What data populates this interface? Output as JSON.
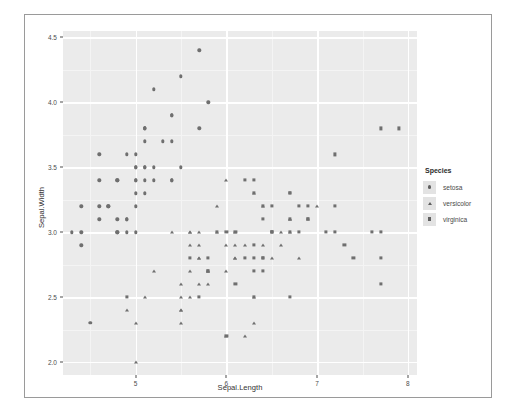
{
  "chart_data": {
    "type": "scatter",
    "title": "",
    "xlabel": "Sepal.Length",
    "ylabel": "Sepal.Width",
    "xlim": [
      4.2,
      8.1
    ],
    "ylim": [
      1.9,
      4.55
    ],
    "xticks": [
      5,
      6,
      7,
      8
    ],
    "xtick_labels": [
      "5",
      "6",
      "7",
      "8"
    ],
    "yticks": [
      2.0,
      2.5,
      3.0,
      3.5,
      4.0,
      4.5
    ],
    "ytick_labels": [
      "2.0",
      "2.5",
      "3.0",
      "3.5",
      "4.0",
      "4.5"
    ],
    "grid": true,
    "panel_background": "#ebebeb",
    "grid_color": "#ffffff",
    "point_color": "#6f6f6f",
    "legend": {
      "title": "Species",
      "position": "right",
      "entries": [
        {
          "label": "setosa",
          "shape": "circle"
        },
        {
          "label": "versicolor",
          "shape": "triangle"
        },
        {
          "label": "virginica",
          "shape": "square"
        }
      ]
    },
    "series": [
      {
        "name": "setosa",
        "shape": "circle",
        "points": [
          [
            5.1,
            3.5
          ],
          [
            4.9,
            3.0
          ],
          [
            4.7,
            3.2
          ],
          [
            4.6,
            3.1
          ],
          [
            5.0,
            3.6
          ],
          [
            5.4,
            3.9
          ],
          [
            4.6,
            3.4
          ],
          [
            5.0,
            3.4
          ],
          [
            4.4,
            2.9
          ],
          [
            4.9,
            3.1
          ],
          [
            5.4,
            3.7
          ],
          [
            4.8,
            3.4
          ],
          [
            4.8,
            3.0
          ],
          [
            4.3,
            3.0
          ],
          [
            5.8,
            4.0
          ],
          [
            5.7,
            4.4
          ],
          [
            5.4,
            3.9
          ],
          [
            5.1,
            3.5
          ],
          [
            5.7,
            3.8
          ],
          [
            5.1,
            3.8
          ],
          [
            5.4,
            3.4
          ],
          [
            5.1,
            3.7
          ],
          [
            4.6,
            3.6
          ],
          [
            5.1,
            3.3
          ],
          [
            4.8,
            3.4
          ],
          [
            5.0,
            3.0
          ],
          [
            5.0,
            3.4
          ],
          [
            5.2,
            3.5
          ],
          [
            5.2,
            3.4
          ],
          [
            4.7,
            3.2
          ],
          [
            4.8,
            3.1
          ],
          [
            5.4,
            3.4
          ],
          [
            5.2,
            4.1
          ],
          [
            5.5,
            4.2
          ],
          [
            4.9,
            3.1
          ],
          [
            5.0,
            3.2
          ],
          [
            5.5,
            3.5
          ],
          [
            4.9,
            3.6
          ],
          [
            4.4,
            3.0
          ],
          [
            5.1,
            3.4
          ],
          [
            5.0,
            3.5
          ],
          [
            4.5,
            2.3
          ],
          [
            4.4,
            3.2
          ],
          [
            5.0,
            3.5
          ],
          [
            5.1,
            3.8
          ],
          [
            4.8,
            3.0
          ],
          [
            5.1,
            3.8
          ],
          [
            4.6,
            3.2
          ],
          [
            5.3,
            3.7
          ],
          [
            5.0,
            3.3
          ]
        ]
      },
      {
        "name": "versicolor",
        "shape": "triangle",
        "points": [
          [
            7.0,
            3.2
          ],
          [
            6.4,
            3.2
          ],
          [
            6.9,
            3.1
          ],
          [
            5.5,
            2.3
          ],
          [
            6.5,
            2.8
          ],
          [
            5.7,
            2.8
          ],
          [
            6.3,
            3.3
          ],
          [
            4.9,
            2.4
          ],
          [
            6.6,
            2.9
          ],
          [
            5.2,
            2.7
          ],
          [
            5.0,
            2.0
          ],
          [
            5.9,
            3.0
          ],
          [
            6.0,
            2.2
          ],
          [
            6.1,
            2.9
          ],
          [
            5.6,
            2.9
          ],
          [
            6.7,
            3.1
          ],
          [
            5.6,
            3.0
          ],
          [
            5.8,
            2.7
          ],
          [
            6.2,
            2.2
          ],
          [
            5.6,
            2.5
          ],
          [
            5.9,
            3.2
          ],
          [
            6.1,
            2.8
          ],
          [
            6.3,
            2.5
          ],
          [
            6.1,
            2.8
          ],
          [
            6.4,
            2.9
          ],
          [
            6.6,
            3.0
          ],
          [
            6.8,
            2.8
          ],
          [
            6.7,
            3.0
          ],
          [
            6.0,
            2.9
          ],
          [
            5.7,
            2.6
          ],
          [
            5.5,
            2.4
          ],
          [
            5.5,
            2.4
          ],
          [
            5.8,
            2.7
          ],
          [
            6.0,
            2.7
          ],
          [
            5.4,
            3.0
          ],
          [
            6.0,
            3.4
          ],
          [
            6.7,
            3.1
          ],
          [
            6.3,
            2.3
          ],
          [
            5.6,
            3.0
          ],
          [
            5.5,
            2.5
          ],
          [
            5.5,
            2.6
          ],
          [
            6.1,
            3.0
          ],
          [
            5.8,
            2.6
          ],
          [
            5.0,
            2.3
          ],
          [
            5.6,
            2.7
          ],
          [
            5.7,
            3.0
          ],
          [
            5.7,
            2.9
          ],
          [
            6.2,
            2.9
          ],
          [
            5.1,
            2.5
          ],
          [
            5.7,
            2.8
          ]
        ]
      },
      {
        "name": "virginica",
        "shape": "square",
        "points": [
          [
            6.3,
            3.3
          ],
          [
            5.8,
            2.7
          ],
          [
            7.1,
            3.0
          ],
          [
            6.3,
            2.9
          ],
          [
            6.5,
            3.0
          ],
          [
            7.6,
            3.0
          ],
          [
            4.9,
            2.5
          ],
          [
            7.3,
            2.9
          ],
          [
            6.7,
            2.5
          ],
          [
            7.2,
            3.6
          ],
          [
            6.5,
            3.2
          ],
          [
            6.4,
            2.7
          ],
          [
            6.8,
            3.0
          ],
          [
            5.7,
            2.5
          ],
          [
            5.8,
            2.8
          ],
          [
            6.4,
            3.2
          ],
          [
            6.5,
            3.0
          ],
          [
            7.7,
            3.8
          ],
          [
            7.7,
            2.6
          ],
          [
            6.0,
            2.2
          ],
          [
            6.9,
            3.2
          ],
          [
            5.6,
            2.8
          ],
          [
            7.7,
            2.8
          ],
          [
            6.3,
            2.7
          ],
          [
            6.7,
            3.3
          ],
          [
            7.2,
            3.2
          ],
          [
            6.2,
            2.8
          ],
          [
            6.1,
            3.0
          ],
          [
            6.4,
            2.8
          ],
          [
            7.2,
            3.0
          ],
          [
            7.4,
            2.8
          ],
          [
            7.9,
            3.8
          ],
          [
            6.4,
            2.8
          ],
          [
            6.3,
            2.8
          ],
          [
            6.1,
            2.6
          ],
          [
            7.7,
            3.0
          ],
          [
            6.3,
            3.4
          ],
          [
            6.4,
            3.1
          ],
          [
            6.0,
            3.0
          ],
          [
            6.9,
            3.1
          ],
          [
            6.7,
            3.1
          ],
          [
            6.9,
            3.1
          ],
          [
            5.8,
            2.7
          ],
          [
            6.8,
            3.2
          ],
          [
            6.7,
            3.3
          ],
          [
            6.7,
            3.0
          ],
          [
            6.3,
            2.5
          ],
          [
            6.5,
            3.0
          ],
          [
            6.2,
            3.4
          ],
          [
            5.9,
            3.0
          ]
        ]
      }
    ]
  }
}
